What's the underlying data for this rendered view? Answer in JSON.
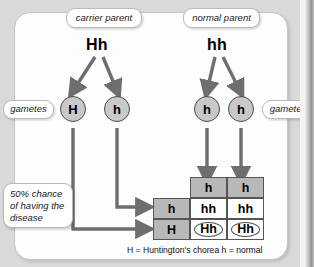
{
  "diagram": {
    "title_legend": "H = Huntington's chorea  h = normal",
    "parents": [
      {
        "label": "carrier parent",
        "genotype": "Hh"
      },
      {
        "label": "normal parent",
        "genotype": "hh"
      }
    ],
    "gamete_labels": {
      "left": "gametes",
      "right": "gametes"
    },
    "gametes": [
      {
        "allele": "H",
        "side": "left"
      },
      {
        "allele": "h",
        "side": "left"
      },
      {
        "allele": "h",
        "side": "right"
      },
      {
        "allele": "h",
        "side": "right"
      }
    ],
    "annotation": "50% chance of having the disease",
    "punnett": {
      "column_headers": [
        "h",
        "h"
      ],
      "row_headers": [
        "h",
        "H"
      ],
      "cells": [
        [
          "hh",
          "hh"
        ],
        [
          "Hh",
          "Hh"
        ]
      ],
      "circled_cells": [
        "Hh",
        "Hh"
      ]
    },
    "colors": {
      "background": "#d9d9d9",
      "panel": "#fdfdfd",
      "header_cell": "#b8b8b8",
      "body_cell": "#ffffff",
      "gamete_fill": "#c9c9c9",
      "arrow": "#6e6e6e",
      "text": "#000000"
    }
  }
}
